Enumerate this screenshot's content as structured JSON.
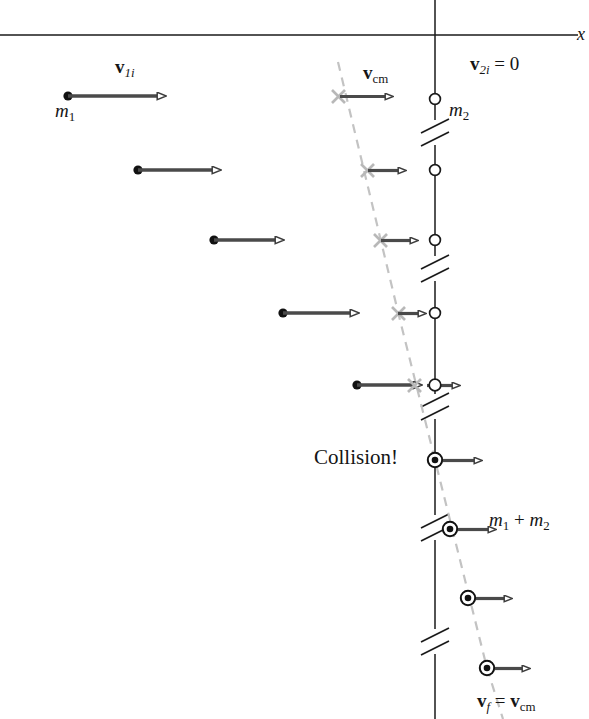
{
  "figure": {
    "kind": "physics-diagram",
    "background_color": "#ffffff"
  },
  "colors": {
    "axis": "#1a1a1a",
    "wall_line": "#1a1a1a",
    "arrow_stroke": "#3d3d3d",
    "arrow_fill": "#ffffff",
    "velocity_shaft": "#4a4a4a",
    "particle_m1_fill": "#111111",
    "particle_m2_fill": "#ffffff",
    "cm_marker": "#b8b8b8",
    "cm_trajectory_dashed": "#c0c0c0",
    "text": "#151515"
  },
  "labels": {
    "axis_x": "x",
    "mass_1": "m",
    "mass_1_sub": "1",
    "mass_2": "m",
    "mass_2_sub": "2",
    "v1i_bold": "v",
    "v1i_sub": "1i",
    "vcm_bold": "v",
    "vcm_sub": "cm",
    "v2i_bold": "v",
    "v2i_sub": "2i",
    "v2i_value": "= 0",
    "collision": "Collision!",
    "combined_mass": "m",
    "combined_mass_sub1": "1",
    "combined_plus": "+",
    "combined_mass2": "m",
    "combined_mass_sub2": "2",
    "vf_bold": "v",
    "vf_sub": "f",
    "vf_eq": "=",
    "vf_cm_bold": "v",
    "vf_cm_sub": "cm"
  },
  "geometry": {
    "x_axis": {
      "y": 35,
      "x_start": 0,
      "x_end": 578
    },
    "wall": {
      "x": 435,
      "y_top": 0,
      "y_bottom": 719
    },
    "wall_breaks_y": [
      132,
      268,
      406,
      527,
      641
    ],
    "rows": [
      {
        "index": 1,
        "y": 96,
        "m1_x": 68,
        "arrow_end": 167,
        "cm_x": 338,
        "cm_arrow_end": 395,
        "m2_x": 435,
        "state": "approach"
      },
      {
        "index": 2,
        "y": 170,
        "m1_x": 138,
        "arrow_end": 222,
        "cm_x": 367,
        "cm_arrow_end": 405,
        "m2_x": 435,
        "state": "approach"
      },
      {
        "index": 3,
        "y": 240,
        "m1_x": 214,
        "arrow_end": 285,
        "cm_x": 380,
        "cm_arrow_end": 417,
        "m2_x": 435,
        "state": "approach"
      },
      {
        "index": 4,
        "y": 313,
        "m1_x": 283,
        "arrow_end": 360,
        "cm_x": 398,
        "cm_arrow_end": 430,
        "m2_x": 435,
        "state": "approach"
      },
      {
        "index": 5,
        "y": 385,
        "m1_x": 357,
        "arrow_end": 432,
        "cm_x": 415,
        "cm_arrow_end": 462,
        "m2_x": 435,
        "state": "contact"
      },
      {
        "index": 6,
        "y": 460,
        "combined_x": 435,
        "arrow_end": 484,
        "state": "collision"
      },
      {
        "index": 7,
        "y": 529,
        "combined_x": 450,
        "arrow_end": 497,
        "state": "after"
      },
      {
        "index": 8,
        "y": 598,
        "combined_x": 468,
        "arrow_end": 513,
        "state": "after"
      },
      {
        "index": 9,
        "y": 668,
        "combined_x": 487,
        "arrow_end": 531,
        "state": "after"
      }
    ],
    "cm_trajectory": [
      {
        "x": 340,
        "y": 68
      },
      {
        "x": 398,
        "y": 312
      },
      {
        "x": 435,
        "y": 460
      },
      {
        "x": 487,
        "y": 668
      },
      {
        "x": 503,
        "y": 719
      }
    ]
  }
}
